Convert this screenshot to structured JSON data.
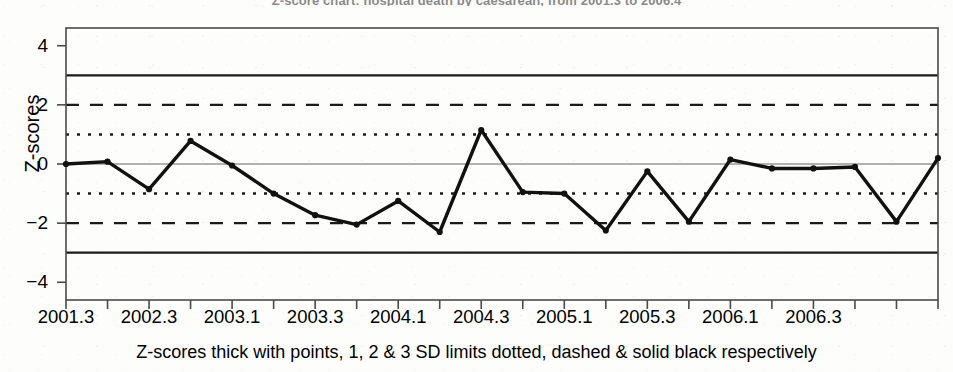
{
  "chart_data": {
    "type": "line",
    "title": "Z-score chart: hospital death by caesarean, from 2001.3 to 2006.4",
    "xlabel": "Z-scores thick with points, 1, 2 & 3 SD limits dotted, dashed & solid black respectively",
    "ylabel": "Z-scores",
    "xlim": [
      2001.3,
      2007.0
    ],
    "ylim": [
      -4.6,
      4.6
    ],
    "grid": false,
    "legend_position": "none",
    "x_tick_labels": [
      "2001.3",
      "2002.3",
      "2003.1",
      "2003.3",
      "2004.1",
      "2004.3",
      "2005.1",
      "2005.3",
      "2006.1",
      "2006.3"
    ],
    "y_tick_labels": [
      "4",
      "2",
      "0",
      "-2",
      "-4"
    ],
    "y_ticks": [
      4,
      2,
      0,
      -2,
      -4
    ],
    "x": [
      2001.3,
      2001.4,
      2002.1,
      2002.2,
      2002.3,
      2002.4,
      2003.1,
      2003.2,
      2003.3,
      2003.4,
      2004.1,
      2004.2,
      2004.3,
      2004.4,
      2005.1,
      2005.2,
      2005.3,
      2005.4,
      2006.1,
      2006.2,
      2006.3,
      2006.4
    ],
    "categories": [
      "2001.3",
      "2001.4",
      "2002.1",
      "2002.2",
      "2002.3",
      "2002.4",
      "2003.1",
      "2003.2",
      "2003.3",
      "2003.4",
      "2004.1",
      "2004.2",
      "2004.3",
      "2004.4",
      "2005.1",
      "2005.2",
      "2005.3",
      "2005.4",
      "2006.1",
      "2006.2",
      "2006.3",
      "2006.4"
    ],
    "series": [
      {
        "name": "Z-scores",
        "style": "thick line with points",
        "values": [
          0.0,
          0.08,
          -0.85,
          0.78,
          -0.05,
          -1.0,
          -1.73,
          -2.05,
          -1.25,
          -2.3,
          1.15,
          -0.95,
          -1.0,
          -2.25,
          -0.25,
          -1.95,
          0.15,
          -0.15,
          -0.15,
          -0.1,
          -1.95,
          0.2
        ]
      }
    ],
    "reference_lines": [
      {
        "name": "+3 SD",
        "value": 3,
        "style": "solid",
        "color": "#1a1a1a"
      },
      {
        "name": "+2 SD",
        "value": 2,
        "style": "dashed",
        "color": "#1a1a1a"
      },
      {
        "name": "+1 SD",
        "value": 1,
        "style": "dotted",
        "color": "#1a1a1a"
      },
      {
        "name": "mean",
        "value": 0,
        "style": "thin-solid",
        "color": "#555555"
      },
      {
        "name": "-1 SD",
        "value": -1,
        "style": "dotted",
        "color": "#1a1a1a"
      },
      {
        "name": "-2 SD",
        "value": -2,
        "style": "dashed",
        "color": "#1a1a1a"
      },
      {
        "name": "-3 SD",
        "value": -3,
        "style": "solid",
        "color": "#1a1a1a"
      }
    ],
    "colors": {
      "line": "#111111",
      "axis": "#444444",
      "background": "#fdfdfc",
      "text": "#000000"
    }
  }
}
